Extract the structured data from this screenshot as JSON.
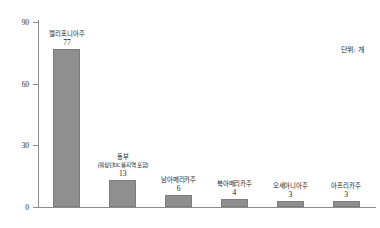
{
  "chart_data": {
    "type": "bar",
    "title": "",
    "subtitle": "",
    "xlabel": "",
    "ylabel": "",
    "unit_note": "단위: 개",
    "ylim": [
      0,
      90
    ],
    "yticks": [
      0,
      30,
      60,
      90
    ],
    "ytick_labels": [
      "0",
      "30",
      "60",
      "90"
    ],
    "grid": false,
    "legend": "none",
    "categories": [
      "캘리포니아주",
      "동부",
      "남아메리카주",
      "북아메리카주",
      "오세아니아주",
      "아프리카주"
    ],
    "category_sublabels": [
      "",
      "(워싱턴DC를 지역 포함)",
      "",
      "",
      "",
      ""
    ],
    "values": [
      77,
      13,
      6,
      4,
      3,
      3
    ],
    "value_labels": [
      "77",
      "13",
      "6",
      "4",
      "3",
      "3"
    ],
    "bar_color": "#8f8f8f",
    "axis_color": "#8d8d8d",
    "text_color": "#1c1c1c"
  }
}
